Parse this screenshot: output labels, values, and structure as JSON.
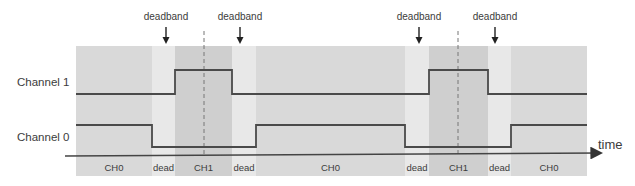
{
  "diagram": {
    "channels": [
      {
        "label": "Channel 1",
        "high_y": 70,
        "low_y": 94
      },
      {
        "label": "Channel 0",
        "high_y": 125,
        "low_y": 147
      }
    ],
    "axis_label": "time",
    "annotations": [
      {
        "label": "deadband",
        "x": 166
      },
      {
        "label": "deadband",
        "x": 240
      },
      {
        "label": "deadband",
        "x": 419
      },
      {
        "label": "deadband",
        "x": 495
      }
    ],
    "regions": [
      {
        "label": "CH0",
        "x0": 76,
        "x1": 152,
        "kind": "ch0"
      },
      {
        "label": "dead",
        "x0": 152,
        "x1": 175,
        "kind": "dead"
      },
      {
        "label": "CH1",
        "x0": 175,
        "x1": 232,
        "kind": "ch1"
      },
      {
        "label": "dead",
        "x0": 232,
        "x1": 256,
        "kind": "dead"
      },
      {
        "label": "CH0",
        "x0": 256,
        "x1": 405,
        "kind": "ch0"
      },
      {
        "label": "dead",
        "x0": 405,
        "x1": 429,
        "kind": "dead"
      },
      {
        "label": "CH1",
        "x0": 429,
        "x1": 488,
        "kind": "ch1"
      },
      {
        "label": "dead",
        "x0": 488,
        "x1": 511,
        "kind": "dead"
      },
      {
        "label": "CH0",
        "x0": 511,
        "x1": 587,
        "kind": "ch0"
      }
    ],
    "center_markers_x": [
      204,
      458
    ],
    "colors": {
      "ch0_region": "#d9d9d9",
      "dead_region": "#e8e8e8",
      "ch1_region": "#cfcfcf",
      "signal": "#4a4a4a",
      "text": "#3c3c3c"
    }
  }
}
